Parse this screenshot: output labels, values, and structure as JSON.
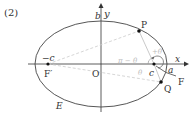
{
  "problem_number": "(2)",
  "labels": {
    "y_axis": "y",
    "x_axis": "x",
    "b": "b",
    "origin": "O",
    "neg_c": "−c",
    "f_prime": "F′",
    "c": "c",
    "a": "a",
    "f": "F",
    "p": "P",
    "q": "Q",
    "ellipse": "E",
    "angle_pi_minus_theta": "π − θ",
    "angle_plus_theta": "+θ",
    "angle_theta": "θ"
  },
  "colors": {
    "curve": "#444444",
    "axis": "#333333",
    "dashed": "#cccccc",
    "point": "#111111"
  }
}
